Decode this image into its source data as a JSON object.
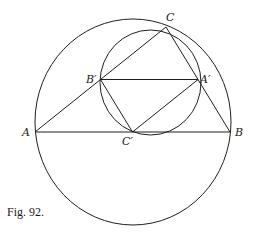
{
  "figure": {
    "caption": "Fig. 92.",
    "stroke_color": "#1f1f1f",
    "background": "#ffffff"
  },
  "points": {
    "A": {
      "label": "A",
      "x": 35,
      "y": 132
    },
    "B": {
      "label": "B",
      "x": 230,
      "y": 132
    },
    "C": {
      "label": "C",
      "x": 166,
      "y": 27
    },
    "A_prime": {
      "label": "A′",
      "x": 198,
      "y": 79.5
    },
    "B_prime": {
      "label": "B′",
      "x": 100.5,
      "y": 79.5
    },
    "C_prime": {
      "label": "C′",
      "x": 132.5,
      "y": 132
    }
  },
  "circles": {
    "circumcircle": {
      "cx": 133,
      "cy": 122,
      "rx": 98,
      "ry": 103
    },
    "nine_point_circle": {
      "cx": 150.5,
      "cy": 82.5,
      "rx": 50.5,
      "ry": 52.5
    }
  },
  "segments": [
    [
      "A",
      "B"
    ],
    [
      "B",
      "C"
    ],
    [
      "C",
      "A"
    ],
    [
      "B_prime",
      "A_prime"
    ],
    [
      "A_prime",
      "C_prime"
    ],
    [
      "C_prime",
      "B_prime"
    ]
  ]
}
